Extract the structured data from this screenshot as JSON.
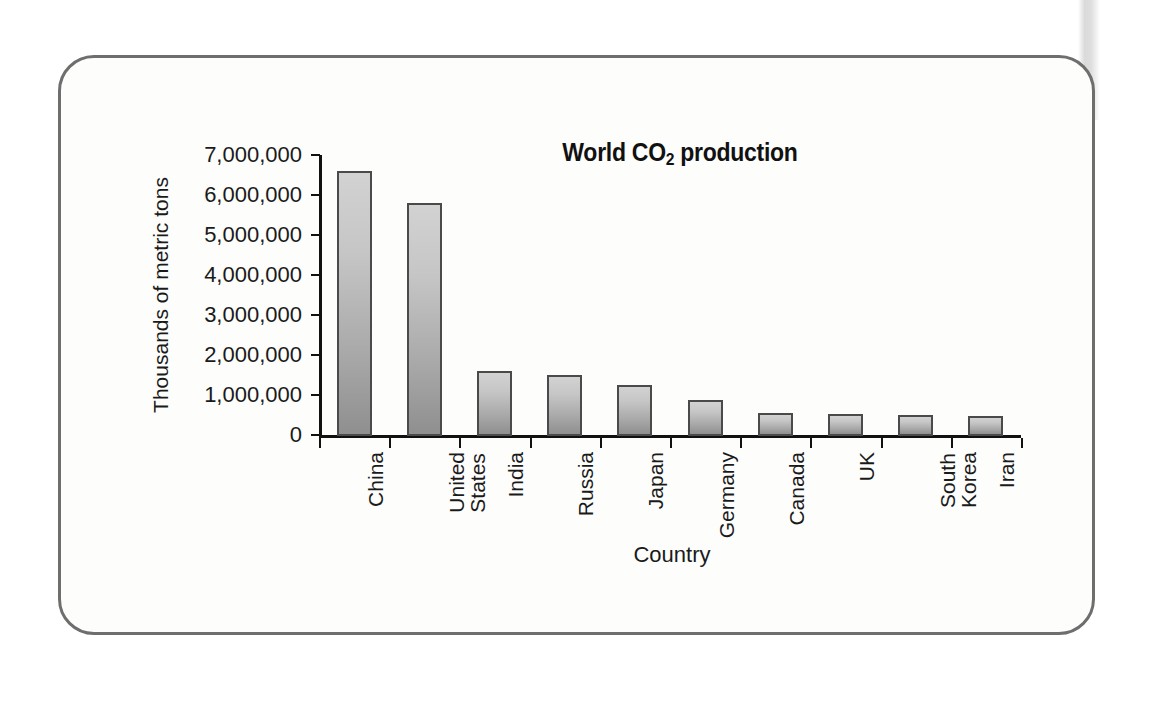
{
  "figure": {
    "frame_border_color": "#6e6e6e",
    "background_color": "#fdfdfc"
  },
  "chart_data": {
    "type": "bar",
    "title": "World CO2 production",
    "title_prefix": "World CO",
    "title_subscript": "2",
    "title_suffix": " production",
    "xlabel": "Country",
    "ylabel": "Thousands of metric tons",
    "categories": [
      "China",
      "United States",
      "India",
      "Russia",
      "Japan",
      "Germany",
      "Canada",
      "UK",
      "South Korea",
      "Iran"
    ],
    "category_lines": [
      [
        "China"
      ],
      [
        "United",
        "States"
      ],
      [
        "India"
      ],
      [
        "Russia"
      ],
      [
        "Japan"
      ],
      [
        "Germany"
      ],
      [
        "Canada"
      ],
      [
        "UK"
      ],
      [
        "South",
        "Korea"
      ],
      [
        "Iran"
      ]
    ],
    "values": [
      6600000,
      5800000,
      1600000,
      1500000,
      1250000,
      880000,
      560000,
      520000,
      490000,
      470000
    ],
    "ylim": [
      0,
      7000000
    ],
    "ytick_values": [
      0,
      1000000,
      2000000,
      3000000,
      4000000,
      5000000,
      6000000,
      7000000
    ],
    "ytick_labels": [
      "0",
      "1,000,000",
      "2,000,000",
      "3,000,000",
      "4,000,000",
      "5,000,000",
      "6,000,000",
      "7,000,000"
    ],
    "grid": false,
    "legend": null,
    "bar_fill_top_color": "#d2d2d2",
    "bar_fill_bottom_color": "#8f8f8f",
    "bar_border_color": "#4a4a4a",
    "axis_color": "#111111"
  }
}
